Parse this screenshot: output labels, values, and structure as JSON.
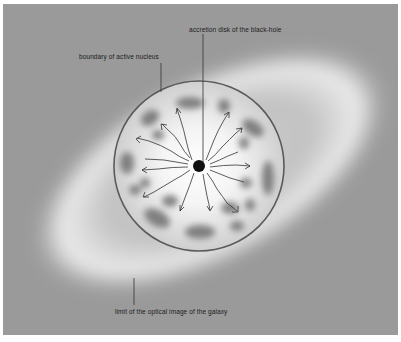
{
  "diagram": {
    "labels": {
      "accretion_disk": "accretion disk of the black-hole",
      "boundary": "boundary of active nucleus",
      "galaxy_limit": "limit of the optical image of the galaxy"
    },
    "colors": {
      "background": "#9a9a9a",
      "halo": "#e8e8e8",
      "circle_stroke": "#555555",
      "clouds": "#6e6e6e",
      "black_hole": "#111111",
      "text": "#1a1a1a"
    }
  }
}
